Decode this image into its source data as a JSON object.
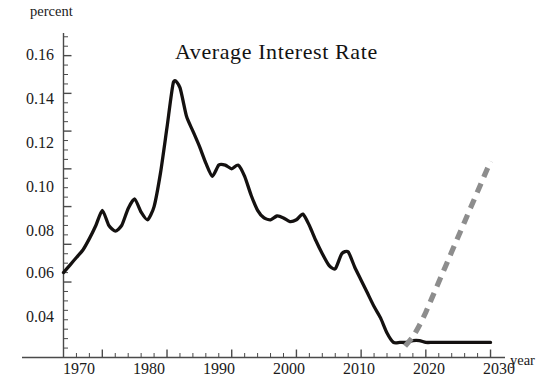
{
  "figure": {
    "title": "Average  Interest  Rate",
    "ylabel": "percent",
    "xlabel": "year"
  },
  "axes": {
    "y_tick_labels": [
      "0.04",
      "0.06",
      "0.08",
      "0.10",
      "0.12",
      "0.14",
      "0.16"
    ],
    "x_tick_labels": [
      "1970",
      "1980",
      "1990",
      "2000",
      "2010",
      "2020",
      "2030"
    ]
  },
  "colors": {
    "historical_line": "#141110",
    "projection_line": "#8d8d8d",
    "axis": "#4a4a4a",
    "background": "#ffffff",
    "text": "#1a1a1a"
  },
  "chart_data": {
    "type": "line",
    "title": "Average  Interest  Rate",
    "xlabel": "year",
    "ylabel": "percent",
    "xlim": [
      1964,
      2031
    ],
    "ylim": [
      0.0,
      0.172
    ],
    "grid": false,
    "legend": false,
    "x_ticks": [
      1970,
      1980,
      1990,
      2000,
      2010,
      2020,
      2030
    ],
    "x_minor_tick_step": 2,
    "y_ticks": [
      0.04,
      0.06,
      0.08,
      0.1,
      0.12,
      0.14,
      0.16
    ],
    "y_minor_tick_step": 0.005,
    "series": [
      {
        "name": "Average Interest Rate (historical)",
        "style": "solid",
        "color": "#141110",
        "x": [
          1964,
          1965,
          1966,
          1967,
          1968,
          1969,
          1970,
          1971,
          1972,
          1973,
          1974,
          1975,
          1976,
          1977,
          1978,
          1979,
          1980,
          1981,
          1982,
          1983,
          1984,
          1985,
          1986,
          1987,
          1988,
          1989,
          1990,
          1991,
          1992,
          1993,
          1994,
          1995,
          1996,
          1997,
          1998,
          1999,
          2000,
          2001,
          2002,
          2003,
          2004,
          2005,
          2006,
          2007,
          2008,
          2009,
          2010,
          2011,
          2012,
          2013,
          2014,
          2015,
          2016,
          2017,
          2018,
          2019,
          2020,
          2021,
          2022,
          2023,
          2024,
          2025,
          2026,
          2027,
          2028,
          2029,
          2030
        ],
        "y": [
          0.045,
          0.049,
          0.053,
          0.057,
          0.063,
          0.07,
          0.078,
          0.07,
          0.067,
          0.07,
          0.079,
          0.084,
          0.077,
          0.073,
          0.08,
          0.098,
          0.122,
          0.146,
          0.143,
          0.128,
          0.12,
          0.112,
          0.103,
          0.096,
          0.102,
          0.102,
          0.1,
          0.102,
          0.096,
          0.086,
          0.078,
          0.074,
          0.073,
          0.075,
          0.074,
          0.072,
          0.073,
          0.076,
          0.07,
          0.062,
          0.055,
          0.049,
          0.047,
          0.055,
          0.056,
          0.048,
          0.041,
          0.034,
          0.027,
          0.021,
          0.013,
          0.008,
          0.008,
          0.008,
          0.009,
          0.009,
          0.008,
          0.008,
          0.008,
          0.008,
          0.008,
          0.008,
          0.008,
          0.008,
          0.008,
          0.008,
          0.008
        ]
      },
      {
        "name": "Projection",
        "style": "dashed",
        "color": "#8d8d8d",
        "x": [
          2016.8,
          2018,
          2019,
          2020,
          2021,
          2022,
          2023,
          2024,
          2025,
          2026,
          2027,
          2028,
          2029,
          2030
        ],
        "y": [
          0.006,
          0.011,
          0.017,
          0.024,
          0.032,
          0.04,
          0.048,
          0.056,
          0.064,
          0.072,
          0.08,
          0.088,
          0.096,
          0.104
        ]
      }
    ]
  }
}
